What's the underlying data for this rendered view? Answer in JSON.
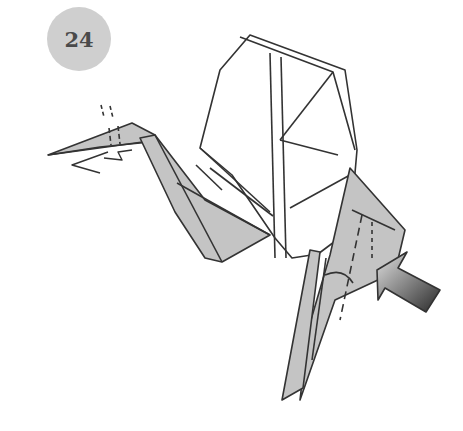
{
  "diagram": {
    "step_number": "24",
    "colors": {
      "paper_front": "#ffffff",
      "paper_back": "#c4c4c4",
      "line": "#333333",
      "badge": "#cfcfcf",
      "arrow_dark": "#2e2e2e",
      "arrow_light": "#d8d8d8"
    },
    "symbols": [
      "valley-fold-line",
      "pleat-arrow",
      "push-arrow",
      "repeat-zigzag"
    ]
  }
}
